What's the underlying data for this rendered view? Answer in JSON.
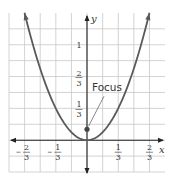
{
  "chart_data": {
    "type": "line",
    "title": "",
    "xlabel": "x",
    "ylabel": "y",
    "function": "y = 3x^2",
    "series": [
      {
        "name": "parabola",
        "x": [
          -0.667,
          -0.5,
          -0.333,
          -0.167,
          0,
          0.167,
          0.333,
          0.5,
          0.667
        ],
        "y": [
          1.333,
          0.75,
          0.333,
          0.083,
          0,
          0.083,
          0.333,
          0.75,
          1.333
        ],
        "color": "#5a5a5a",
        "arrows_at_ends": true
      }
    ],
    "points": [
      {
        "name": "focus",
        "x": 0,
        "y": 0.0833,
        "color": "#444444"
      }
    ],
    "annotations": [
      {
        "text": "Focus",
        "target": "focus"
      }
    ],
    "xlim": [
      -0.833,
      0.833
    ],
    "ylim": [
      -0.333,
      1.333
    ],
    "grid_step": 0.1667,
    "grid": true,
    "x_ticks": [
      {
        "value": -0.667,
        "num": "2",
        "den": "3",
        "neg": true
      },
      {
        "value": -0.333,
        "num": "1",
        "den": "3",
        "neg": true
      },
      {
        "value": 0.333,
        "num": "1",
        "den": "3",
        "neg": false
      },
      {
        "value": 0.667,
        "num": "2",
        "den": "3",
        "neg": false
      }
    ],
    "y_ticks": [
      {
        "value": 0.333,
        "num": "1",
        "den": "3"
      },
      {
        "value": 0.667,
        "num": "2",
        "den": "3"
      },
      {
        "value": 1,
        "whole": "1"
      }
    ]
  }
}
